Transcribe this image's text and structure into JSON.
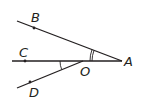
{
  "diagram": {
    "type": "geometry-angle-figure",
    "labels": {
      "A": "A",
      "B": "B",
      "C": "C",
      "D": "D",
      "O": "O"
    },
    "points": {
      "A": [
        122,
        61
      ],
      "B": [
        34,
        28
      ],
      "C": [
        25,
        61
      ],
      "D": [
        30,
        82
      ],
      "O": [
        83,
        61
      ]
    },
    "segments": [
      {
        "from": "A",
        "to": "B-end",
        "description": "ray AB"
      },
      {
        "from": "A",
        "to": "C-end",
        "description": "ray AC through O"
      },
      {
        "from": "O",
        "to": "D-end",
        "description": "ray OD"
      }
    ],
    "angle_marks": [
      {
        "vertex": "A",
        "between": [
          "B",
          "C"
        ],
        "arcs": 2
      },
      {
        "vertex": "O",
        "between": [
          "C",
          "D"
        ],
        "arcs": 1
      }
    ],
    "line_color": "#231f20"
  }
}
